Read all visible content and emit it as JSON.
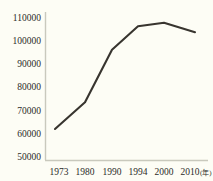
{
  "chart_data": {
    "type": "line",
    "title": "",
    "xlabel": "年",
    "ylabel": "",
    "categories": [
      "1973",
      "1980",
      "1990",
      "1994",
      "2000",
      "2010"
    ],
    "x": [
      1973,
      1980,
      1990,
      1994,
      2000,
      2010
    ],
    "values": [
      62000,
      73500,
      96000,
      106000,
      107500,
      103500
    ],
    "series": [
      {
        "name": "",
        "values": [
          62000,
          73500,
          96000,
          106000,
          107500,
          103500
        ]
      }
    ],
    "ylim": [
      50000,
      110000
    ],
    "yticks": [
      50000,
      60000,
      70000,
      80000,
      90000,
      100000,
      110000
    ],
    "ytick_labels": [
      "50000",
      "60000",
      "70000",
      "80000",
      "90000",
      "100000",
      "110000"
    ],
    "xtick_labels": [
      "1973",
      "1980",
      "1990",
      "1994",
      "2000",
      "2010"
    ],
    "x_unit_label": "(年)",
    "grid": false,
    "legend": false,
    "legend_position": "none",
    "line_color": "#38352f",
    "axis_color": "#c9c9bd",
    "background_color": "#fdfdf5",
    "text_color": "#2b2b28"
  }
}
